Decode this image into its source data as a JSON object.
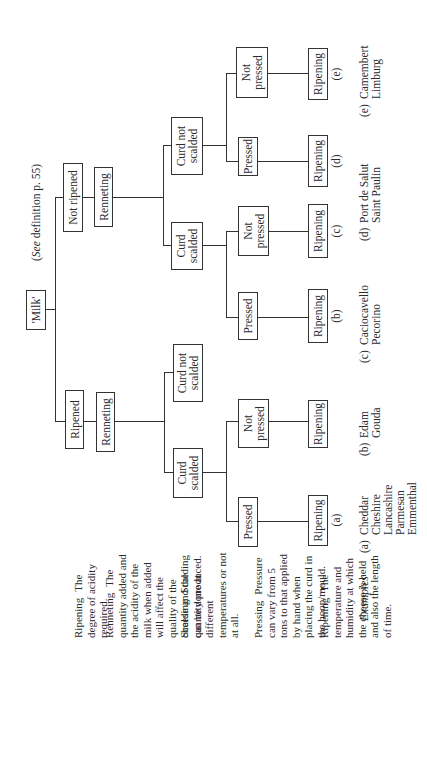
{
  "root": {
    "label": "'Milk'",
    "note": "(See definition p. 55)",
    "note_italic": "See"
  },
  "level1": {
    "ripened": {
      "label": "Ripened",
      "process": "Renneting"
    },
    "not_ripened": {
      "label": "Not ripened",
      "process": "Renneting"
    }
  },
  "level2": {
    "ripened_scalded": "Curd scalded",
    "ripened_not_scalded": "Curd not scalded",
    "notripened_scalded": "Curd scalded",
    "notripened_not_scalded": "Curd not scalded"
  },
  "level3": {
    "a": "Pressed",
    "r_not_pressed": "Not pressed",
    "b": "Pressed",
    "c": "Not pressed",
    "d": "Pressed",
    "e": "Not pressed"
  },
  "ripening_label": "Ripening",
  "leaf_tags": {
    "a": "(a)",
    "b": "(b)",
    "c": "(c)",
    "d": "(d)",
    "e": "(e)"
  },
  "definitions": [
    {
      "term": "Ripening",
      "text": "The degree of acidity required."
    },
    {
      "term": "Renneting",
      "text": "The quantity added and the acidity of the milk when added will affect the quality of the cheese and the quantity produced."
    },
    {
      "term": "Scalding",
      "text": "Scalding can be done at different temperatures or not at all."
    },
    {
      "term": "Pressing",
      "text": "Pressure can vary from 5 tons to that applied by hand when placing the curd in the hoop/mould."
    },
    {
      "term": "Ripening",
      "text": "The temperature and humidity at which the cheese is held and also the length of time."
    }
  ],
  "examples": {
    "heading": "Examples",
    "groups": [
      {
        "key": "(a)",
        "names": [
          "Cheddar",
          "Cheshire",
          "Lancashire",
          "Parmesan",
          "Emmenthal"
        ]
      },
      {
        "key": "(b)",
        "names": [
          "Edam",
          "Gouda"
        ]
      },
      {
        "key": "(c)",
        "names": [
          "Caciocavello",
          "Pecorino"
        ]
      },
      {
        "key": "(d)",
        "names": [
          "Port de Salut",
          "Saint Paulin"
        ]
      },
      {
        "key": "(e)",
        "names": [
          "Camembert",
          "Limburg"
        ]
      }
    ]
  }
}
